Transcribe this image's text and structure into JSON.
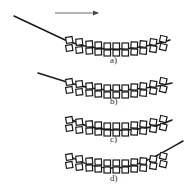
{
  "figure": {
    "type": "diagram",
    "title": "",
    "background_color": "#ffffff",
    "ink_color": "#1a1a1a",
    "square_fill": "#ffffff",
    "square_stroke": "#1a1a1a",
    "width": 186,
    "height": 192,
    "direction_arrow": {
      "name": "direction-arrow",
      "x1": 55,
      "y1": 13,
      "x2": 100,
      "y2": 13,
      "label": ""
    },
    "panels": [
      {
        "id": "a",
        "label": "a)",
        "label_x": 110,
        "label_y": 60,
        "curve": {
          "description": "straight line entering from upper-left, bending into the chain",
          "path": "M 14 16 L 63 39 C 78 46 100 50 120 49 C 140 48 158 44 170 40",
          "visible": true,
          "enters": "upper-left",
          "exits": "none"
        },
        "chain": {
          "rows": 2,
          "top_count": 11,
          "bottom_count": 11,
          "start_x": 66,
          "end_x": 172,
          "baseline_y": 44,
          "sag": 7
        }
      },
      {
        "id": "b",
        "label": "b)",
        "label_x": 110,
        "label_y": 101,
        "curve": {
          "description": "shorter straight line entering from left, bending into the chain",
          "path": "M 38 73 L 70 83 C 86 88 104 91 124 90 C 144 89 160 86 172 83",
          "visible": true,
          "enters": "left",
          "exits": "none"
        },
        "chain": {
          "rows": 2,
          "top_count": 11,
          "bottom_count": 11,
          "start_x": 66,
          "end_x": 172,
          "baseline_y": 86,
          "sag": 7
        }
      },
      {
        "id": "c",
        "label": "c)",
        "label_x": 110,
        "label_y": 139,
        "curve": {
          "description": "curve fully contained inside the chain, no external tail",
          "path": "M 68 118 C 86 128 106 131 126 130 C 146 129 162 125 172 120",
          "visible": true,
          "enters": "none",
          "exits": "none"
        },
        "chain": {
          "rows": 2,
          "top_count": 11,
          "bottom_count": 11,
          "start_x": 66,
          "end_x": 172,
          "baseline_y": 124,
          "sag": 7
        }
      },
      {
        "id": "d",
        "label": "d)",
        "label_x": 110,
        "label_y": 178,
        "curve": {
          "description": "curve exiting to the upper-right out of the chain",
          "path": "M 68 155 C 86 167 106 170 126 167 C 144 164 160 154 180 143",
          "visible": true,
          "enters": "none",
          "exits": "upper-right"
        },
        "chain": {
          "rows": 2,
          "top_count": 11,
          "bottom_count": 11,
          "start_x": 66,
          "end_x": 172,
          "baseline_y": 161,
          "sag": 7
        }
      }
    ]
  }
}
